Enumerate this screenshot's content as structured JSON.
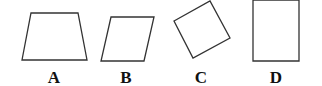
{
  "figures": [
    {
      "label": "A",
      "shape": "trapezoid",
      "points": "31,13 78,13 87,60 22,60"
    },
    {
      "label": "B",
      "shape": "parallelogram",
      "points": "111,17 154,17 144,61 101,61"
    },
    {
      "label": "C",
      "shape": "rotated-square",
      "points": "174,21 210,1 230,38 193,58"
    },
    {
      "label": "D",
      "shape": "rectangle",
      "points": "253,0 299,0 299,61 253,61"
    }
  ],
  "colors": {
    "stroke": "#333333",
    "label": "#111111"
  }
}
